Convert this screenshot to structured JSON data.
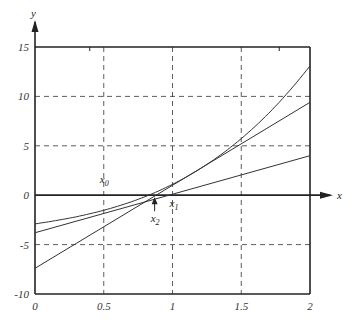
{
  "chart_data": {
    "type": "line",
    "title": "",
    "xlabel": "x",
    "ylabel": "y",
    "xlim": [
      0,
      2
    ],
    "ylim": [
      -10,
      15
    ],
    "x_ticks": [
      "0",
      "0.5",
      "1",
      "1.5",
      "2"
    ],
    "y_ticks": [
      "15",
      "10",
      "5",
      "0",
      "-5",
      "-10"
    ],
    "grid": "dashed",
    "series": [
      {
        "name": "curve f(x)",
        "x": [
          0,
          0.25,
          0.5,
          0.75,
          1,
          1.25,
          1.5,
          1.75,
          2
        ],
        "y": [
          -2.9,
          -2.32,
          -1.53,
          -0.46,
          1.1,
          3.11,
          5.73,
          9.02,
          13.1
        ]
      },
      {
        "name": "line through x0 (steep)",
        "x": [
          0,
          2
        ],
        "y": [
          -7.4,
          9.4
        ]
      },
      {
        "name": "line (shallow)",
        "x": [
          0,
          2
        ],
        "y": [
          -3.8,
          4.0
        ]
      }
    ],
    "annotations": [
      {
        "text": "x0",
        "x": 0.5,
        "y": 0
      },
      {
        "text": "x1",
        "x": 1.0,
        "y": 0
      },
      {
        "text": "x2",
        "x": 0.87,
        "y": 0
      }
    ]
  },
  "labels": {
    "x_axis": "x",
    "y_axis": "y",
    "x0": "x",
    "x0_sub": "0",
    "x1": "x",
    "x1_sub": "1",
    "x2": "x",
    "x2_sub": "2"
  }
}
